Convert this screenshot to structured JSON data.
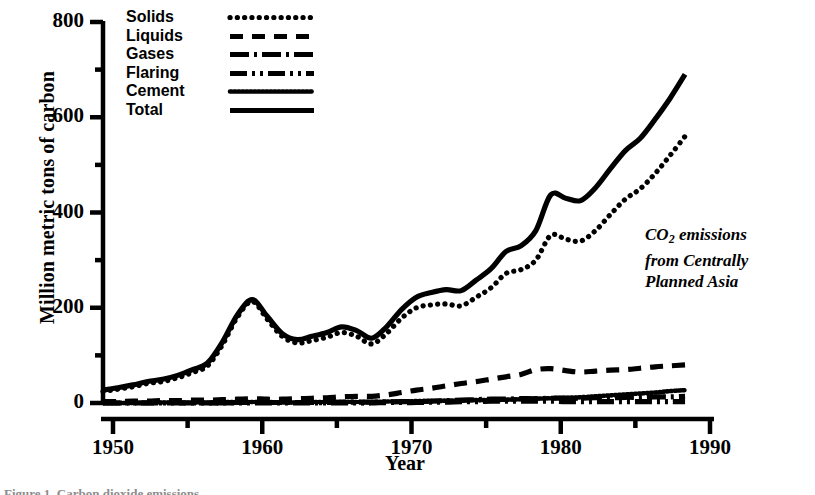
{
  "figure": {
    "annotation_line1_prefix": "CO",
    "annotation_line1_sub": "2",
    "annotation_line1_suffix": " emissions",
    "annotation_line2": "from Centrally",
    "annotation_line3": "Planned Asia",
    "annotation_full": "CO2 emissions from Centrally Planned Asia",
    "caption_fragment": "Figure 1. Carbon dioxide emissions"
  },
  "legend": {
    "position": "upper-left-inside",
    "items": [
      {
        "label": "Solids",
        "style": "coarse-dotted",
        "dasharray": "0.1 7.2",
        "linecap": "butt",
        "width": 5.2
      },
      {
        "label": "Liquids",
        "style": "dashed",
        "dasharray": "13 9",
        "linecap": "butt",
        "width": 5.2
      },
      {
        "label": "Gases",
        "style": "dash-dot",
        "dasharray": "19 5 3 5",
        "linecap": "butt",
        "width": 5.2
      },
      {
        "label": "Flaring",
        "style": "dash-dot-dot",
        "dasharray": "17 5 3 5 3 5",
        "linecap": "butt",
        "width": 5.2
      },
      {
        "label": "Cement",
        "style": "fine-dotted",
        "dasharray": "1.6 2.4",
        "linecap": "butt",
        "width": 4.6
      },
      {
        "label": "Total",
        "style": "solid",
        "dasharray": "none",
        "linecap": "butt",
        "width": 5.2
      }
    ]
  },
  "chart_data": {
    "type": "line",
    "title": "",
    "xlabel": "Year",
    "ylabel": "Million metric tons of carbon",
    "xlim": [
      1950,
      1990
    ],
    "ylim": [
      0,
      800
    ],
    "grid": false,
    "x_major_ticks": [
      1950,
      1960,
      1970,
      1980,
      1990
    ],
    "x_minor_ticks": [
      1955,
      1965,
      1975,
      1985
    ],
    "x_tick_labels": [
      "1950",
      "1960",
      "1970",
      "1980",
      "1990"
    ],
    "y_major_ticks": [
      0,
      200,
      400,
      600,
      800
    ],
    "y_minor_ticks": [
      100,
      300,
      500,
      700
    ],
    "y_tick_labels": [
      "0",
      "200",
      "400",
      "600",
      "800"
    ],
    "x": [
      1950,
      1951,
      1952,
      1953,
      1954,
      1955,
      1956,
      1957,
      1958,
      1959,
      1960,
      1961,
      1962,
      1963,
      1964,
      1965,
      1966,
      1967,
      1968,
      1969,
      1970,
      1971,
      1972,
      1973,
      1974,
      1975,
      1976,
      1977,
      1978,
      1979,
      1980,
      1981,
      1982,
      1983,
      1984,
      1985,
      1986,
      1987,
      1988,
      1989
    ],
    "series": [
      {
        "name": "Total",
        "style": "solid",
        "values": [
          27,
          32,
          38,
          45,
          50,
          58,
          70,
          84,
          128,
          185,
          217,
          182,
          146,
          133,
          140,
          148,
          160,
          152,
          136,
          160,
          196,
          222,
          232,
          238,
          236,
          258,
          282,
          318,
          330,
          362,
          437,
          430,
          425,
          452,
          492,
          530,
          556,
          596,
          640,
          690
        ]
      },
      {
        "name": "Solids",
        "style": "coarse-dotted",
        "values": [
          24,
          29,
          34,
          41,
          45,
          53,
          64,
          78,
          122,
          180,
          213,
          176,
          140,
          126,
          131,
          138,
          148,
          140,
          124,
          146,
          178,
          200,
          206,
          208,
          204,
          222,
          242,
          272,
          280,
          300,
          352,
          344,
          340,
          362,
          396,
          428,
          450,
          482,
          520,
          560
        ]
      },
      {
        "name": "Liquids",
        "style": "dashed",
        "values": [
          3,
          3,
          4,
          4,
          5,
          5,
          6,
          6,
          7,
          8,
          9,
          8,
          8,
          9,
          10,
          11,
          13,
          14,
          14,
          17,
          22,
          27,
          31,
          36,
          41,
          45,
          50,
          55,
          60,
          70,
          72,
          68,
          65,
          67,
          69,
          70,
          73,
          76,
          78,
          80
        ]
      },
      {
        "name": "Gases",
        "style": "dash-dot",
        "values": [
          0,
          0,
          0,
          0,
          0,
          0,
          0,
          0,
          0,
          1,
          1,
          1,
          1,
          1,
          1,
          1,
          2,
          2,
          2,
          2,
          3,
          3,
          4,
          5,
          6,
          7,
          8,
          8,
          9,
          9,
          10,
          10,
          10,
          11,
          11,
          12,
          12,
          13,
          13,
          14
        ]
      },
      {
        "name": "Flaring",
        "style": "dash-dot-dot",
        "values": [
          0,
          0,
          0,
          0,
          0,
          0,
          0,
          0,
          0,
          0,
          0,
          0,
          0,
          0,
          0,
          0,
          0,
          0,
          0,
          1,
          1,
          1,
          2,
          2,
          3,
          3,
          4,
          4,
          4,
          4,
          4,
          3,
          3,
          3,
          3,
          3,
          3,
          3,
          3,
          3
        ]
      },
      {
        "name": "Cement",
        "style": "fine-dotted",
        "values": [
          0,
          0,
          0,
          1,
          1,
          1,
          1,
          1,
          2,
          2,
          2,
          2,
          1,
          1,
          2,
          2,
          2,
          2,
          2,
          3,
          3,
          4,
          4,
          5,
          5,
          6,
          6,
          7,
          8,
          9,
          10,
          11,
          12,
          14,
          16,
          18,
          20,
          22,
          25,
          27
        ]
      }
    ]
  },
  "colors": {
    "ink": "#000000",
    "background": "#ffffff"
  }
}
